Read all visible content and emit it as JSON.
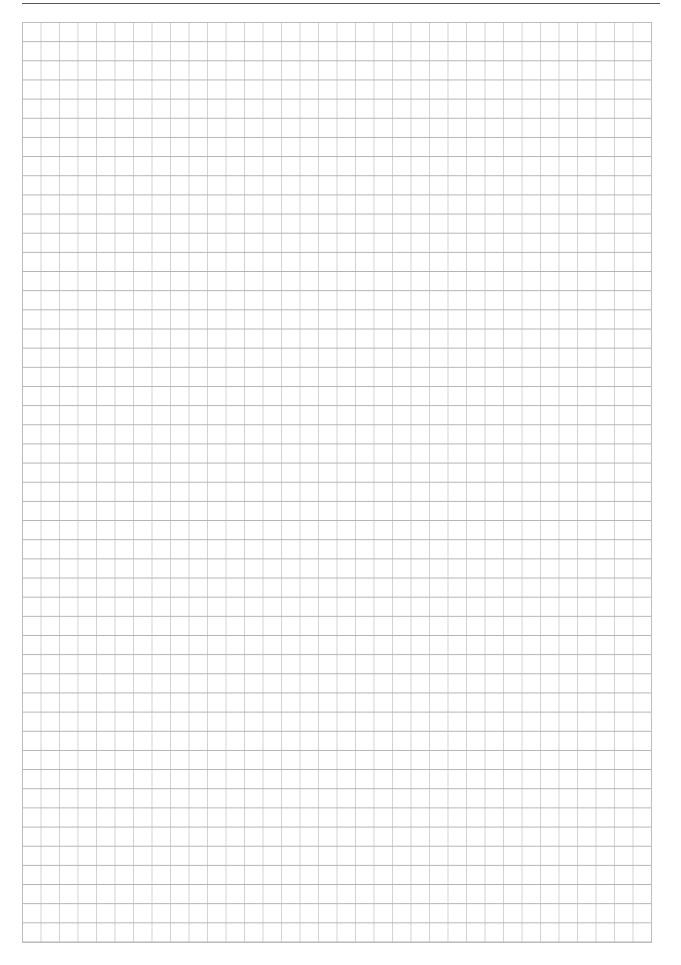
{
  "page": {
    "header_text": "",
    "header_text_note_visible": "text clipped at top edge; only descenders visible"
  },
  "grid": {
    "left": 22,
    "top": 22,
    "columns": 34,
    "rows": 48,
    "cell_width": 18.5,
    "cell_height": 19.17,
    "colors": {
      "horizontal_line": "#b3b3b3",
      "vertical_line": "#d2d2d2",
      "border": "#bdbdbd",
      "header_rule": "#555555",
      "background": "#ffffff"
    }
  }
}
